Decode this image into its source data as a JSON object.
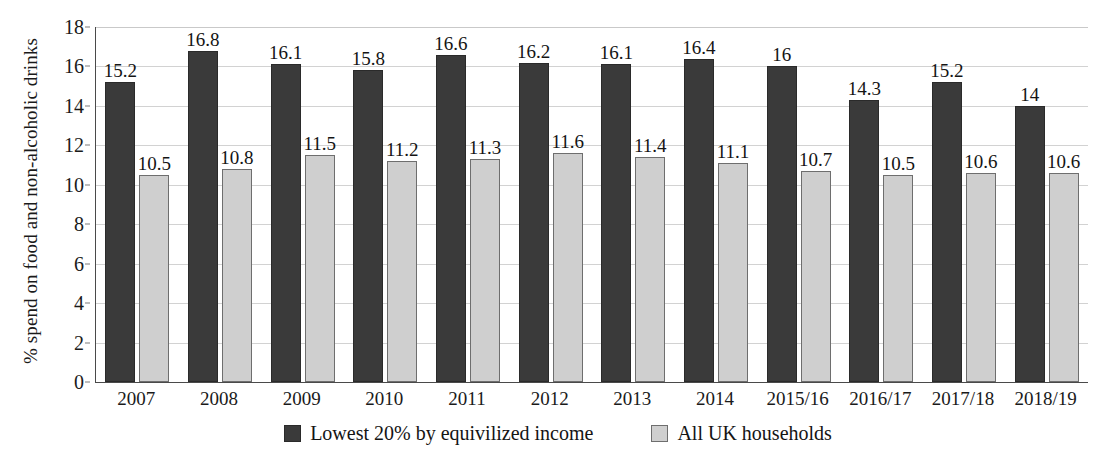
{
  "chart_data": {
    "type": "bar",
    "title": "",
    "subtitle": "",
    "xlabel": "",
    "ylabel": "% spend on food and non-alcoholic drinks",
    "ylim": [
      0,
      18
    ],
    "y_ticks": [
      0,
      2,
      4,
      6,
      8,
      10,
      12,
      14,
      16,
      18
    ],
    "grid": true,
    "legend_position": "bottom",
    "categories": [
      "2007",
      "2008",
      "2009",
      "2010",
      "2011",
      "2012",
      "2013",
      "2014",
      "2015/16",
      "2016/17",
      "2017/18",
      "2018/19"
    ],
    "series": [
      {
        "name": "Lowest 20% by equivilized income",
        "color": "#3a3a3a",
        "values": [
          15.2,
          16.8,
          16.1,
          15.8,
          16.6,
          16.2,
          16.1,
          16.4,
          16,
          14.3,
          15.2,
          14
        ],
        "labels": [
          "15.2",
          "16.8",
          "16.1",
          "15.8",
          "16.6",
          "16.2",
          "16.1",
          "16.4",
          "16",
          "14.3",
          "15.2",
          "14"
        ]
      },
      {
        "name": "All UK households",
        "color": "#cfcfcf",
        "values": [
          10.5,
          10.8,
          11.5,
          11.2,
          11.3,
          11.6,
          11.4,
          11.1,
          10.7,
          10.5,
          10.6,
          10.6
        ],
        "labels": [
          "10.5",
          "10.8",
          "11.5",
          "11.2",
          "11.3",
          "11.6",
          "11.4",
          "11.1",
          "10.7",
          "10.5",
          "10.6",
          "10.6"
        ]
      }
    ]
  },
  "axis": {
    "y_title": "% spend on food and non-alcoholic drinks",
    "y_tick_labels": [
      "18",
      "16",
      "14",
      "12",
      "10",
      "8",
      "6",
      "4",
      "2",
      "0"
    ]
  },
  "legend": {
    "items": [
      {
        "label": "Lowest 20% by equivilized income",
        "swatch": "dark-square-icon"
      },
      {
        "label": "All UK households",
        "swatch": "light-square-icon"
      }
    ]
  },
  "colors": {
    "series_dark": "#3a3a3a",
    "series_light": "#cfcfcf",
    "gridline": "#d2d2d2",
    "axis": "#4a4a4a",
    "text": "#141414",
    "background": "#ffffff"
  }
}
